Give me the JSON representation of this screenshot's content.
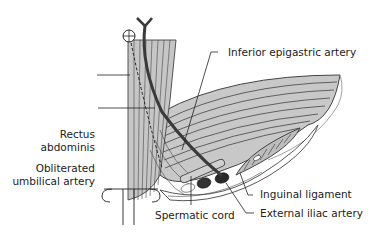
{
  "diagram": {
    "type": "anatomical illustration",
    "colors": {
      "muscle_fill": "#c8c8c8",
      "muscle_line": "#444444",
      "artery": "#3a3a3a",
      "vessel_dark": "#2a2a2a",
      "background": "#ffffff",
      "label_text": "#222222"
    },
    "labels": {
      "inferior_epigastric_artery": "Inferior epigastric artery",
      "rectus_abdominis_line1": "Rectus",
      "rectus_abdominis_line2": "abdominis",
      "obliterated_umbilical_line1": "Obliterated",
      "obliterated_umbilical_line2": "umbilical artery",
      "inguinal_ligament": "Inguinal ligament",
      "spermatic_cord": "Spermatic cord",
      "external_iliac_artery": "External iliac artery"
    }
  }
}
